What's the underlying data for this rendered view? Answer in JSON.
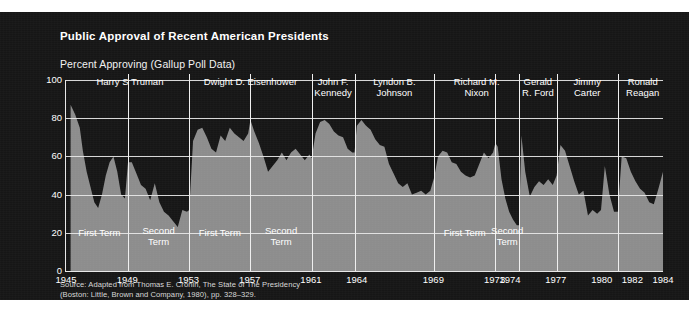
{
  "figure": {
    "title": "Public Approval of Recent American Presidents",
    "subtitle": "Percent Approving (Gallup Poll Data)",
    "source_line1": "Source: Adapted from Thomas E. Cronin, The State of The Presidency",
    "source_line2": "(Boston: Little, Brown and Company, 1980), pp. 328–329.",
    "colors": {
      "panel_background": "#161616",
      "area_fill": "#8d8d8d",
      "grid": "#e8e8e8",
      "text": "#ffffff",
      "page": "#ffffff"
    }
  },
  "chart_data": {
    "type": "area",
    "title": "Public Approval of Recent American Presidents",
    "subtitle": "Percent Approving (Gallup Poll Data)",
    "xlabel": "",
    "ylabel": "Percent Approving (Gallup Poll Data)",
    "ylim": [
      0,
      100
    ],
    "xlim": [
      1945,
      1984
    ],
    "grid": true,
    "legend": "none",
    "ytick_labels": [
      "0",
      "20",
      "40",
      "60",
      "80",
      "100"
    ],
    "ytick_values": [
      0,
      20,
      40,
      60,
      80,
      100
    ],
    "xtick_labels": [
      "1945",
      "1949",
      "1953",
      "1957",
      "1961",
      "1964",
      "1969",
      "1973",
      "1974",
      "1977",
      "1980",
      "1982",
      "1984"
    ],
    "xtick_values": [
      1945,
      1949,
      1953,
      1957,
      1961,
      1964,
      1969,
      1973,
      1974,
      1977,
      1980,
      1982,
      1984
    ],
    "presidents": [
      {
        "name": "Harry S Truman",
        "label": "Harry S Truman",
        "start": 1945.3,
        "end": 1953.05,
        "terms": [
          {
            "label": "First Term",
            "start": 1945.3,
            "end": 1949.05
          },
          {
            "label": "Second Term",
            "start": 1949.05,
            "end": 1953.05
          }
        ]
      },
      {
        "name": "Dwight D. Eisenhower",
        "label": "Dwight D. Eisenhower",
        "start": 1953.05,
        "end": 1961.05,
        "terms": [
          {
            "label": "First Term",
            "start": 1953.05,
            "end": 1957.05
          },
          {
            "label": "Second Term",
            "start": 1957.05,
            "end": 1961.05
          }
        ]
      },
      {
        "name": "John F. Kennedy",
        "label": "John F.\nKennedy",
        "start": 1961.05,
        "end": 1963.85,
        "terms": []
      },
      {
        "name": "Lyndon B. Johnson",
        "label": "Lyndon B.\nJohnson",
        "start": 1963.85,
        "end": 1969.05,
        "terms": []
      },
      {
        "name": "Richard M. Nixon",
        "label": "Richard M.\nNixon",
        "start": 1969.05,
        "end": 1974.6,
        "terms": [
          {
            "label": "First Term",
            "start": 1969.05,
            "end": 1973.05
          },
          {
            "label": "Second Term",
            "start": 1973.05,
            "end": 1974.6
          }
        ]
      },
      {
        "name": "Gerald R. Ford",
        "label": "Gerald\nR. Ford",
        "start": 1974.6,
        "end": 1977.05,
        "terms": []
      },
      {
        "name": "Jimmy Carter",
        "label": "Jimmy\nCarter",
        "start": 1977.05,
        "end": 1981.05,
        "terms": []
      },
      {
        "name": "Ronald Reagan",
        "label": "Ronald\nReagan",
        "start": 1981.05,
        "end": 1984.3,
        "terms": []
      }
    ],
    "series": [
      {
        "name": "Presidential Approval",
        "x": [
          1945.3,
          1945.6,
          1945.9,
          1946.1,
          1946.35,
          1946.6,
          1946.85,
          1947.1,
          1947.35,
          1947.6,
          1947.85,
          1948.1,
          1948.35,
          1948.6,
          1948.85,
          1949.05,
          1949.3,
          1949.6,
          1949.9,
          1950.2,
          1950.5,
          1950.8,
          1951.1,
          1951.4,
          1951.7,
          1952.0,
          1952.3,
          1952.6,
          1952.9,
          1953.05,
          1953.3,
          1953.6,
          1953.9,
          1954.2,
          1954.5,
          1954.8,
          1955.1,
          1955.4,
          1955.7,
          1956.0,
          1956.3,
          1956.6,
          1956.9,
          1957.05,
          1957.3,
          1957.6,
          1957.9,
          1958.2,
          1958.5,
          1958.8,
          1959.1,
          1959.4,
          1959.7,
          1960.0,
          1960.3,
          1960.6,
          1960.9,
          1961.05,
          1961.3,
          1961.6,
          1961.9,
          1962.2,
          1962.5,
          1962.8,
          1963.1,
          1963.4,
          1963.7,
          1963.85,
          1964.0,
          1964.3,
          1964.6,
          1964.9,
          1965.2,
          1965.5,
          1965.8,
          1966.1,
          1966.4,
          1966.7,
          1967.0,
          1967.3,
          1967.6,
          1967.9,
          1968.2,
          1968.5,
          1968.8,
          1969.05,
          1969.3,
          1969.6,
          1969.9,
          1970.2,
          1970.5,
          1970.8,
          1971.1,
          1971.4,
          1971.7,
          1972.0,
          1972.3,
          1972.6,
          1972.9,
          1973.05,
          1973.2,
          1973.45,
          1973.7,
          1973.95,
          1974.2,
          1974.45,
          1974.6,
          1974.75,
          1975.0,
          1975.3,
          1975.6,
          1975.9,
          1976.2,
          1976.5,
          1976.8,
          1977.05,
          1977.3,
          1977.6,
          1977.9,
          1978.2,
          1978.5,
          1978.8,
          1979.1,
          1979.4,
          1979.7,
          1979.95,
          1980.2,
          1980.5,
          1980.8,
          1981.05,
          1981.3,
          1981.6,
          1981.9,
          1982.2,
          1982.5,
          1982.8,
          1983.1,
          1983.4,
          1983.7,
          1984.0,
          1984.3
        ],
        "values": [
          87,
          82,
          75,
          63,
          52,
          44,
          36,
          33,
          40,
          50,
          57,
          60,
          52,
          40,
          38,
          57,
          57,
          51,
          45,
          43,
          37,
          46,
          36,
          31,
          29,
          26,
          23,
          32,
          31,
          32,
          68,
          74,
          75,
          70,
          64,
          62,
          71,
          68,
          75,
          72,
          70,
          68,
          72,
          79,
          73,
          67,
          60,
          52,
          55,
          58,
          62,
          58,
          62,
          64,
          61,
          58,
          61,
          59,
          72,
          78,
          79,
          77,
          73,
          71,
          70,
          64,
          62,
          62,
          76,
          79,
          76,
          74,
          69,
          66,
          65,
          56,
          51,
          46,
          44,
          46,
          40,
          41,
          42,
          40,
          42,
          49,
          60,
          63,
          62,
          57,
          56,
          52,
          50,
          49,
          50,
          56,
          62,
          59,
          62,
          67,
          65,
          48,
          38,
          31,
          27,
          24,
          24,
          71,
          52,
          39,
          44,
          47,
          45,
          48,
          45,
          50,
          66,
          63,
          55,
          47,
          40,
          42,
          29,
          32,
          30,
          32,
          55,
          40,
          31,
          31,
          60,
          59,
          52,
          47,
          43,
          41,
          36,
          35,
          43,
          52,
          55
        ]
      }
    ]
  }
}
